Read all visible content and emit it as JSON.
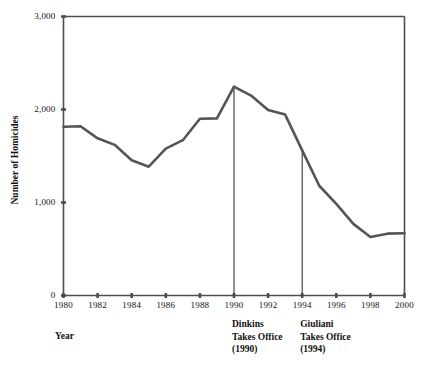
{
  "chart_data": {
    "type": "line",
    "title": "",
    "xlabel": "Year",
    "ylabel": "Number of Homicides",
    "xlim": [
      1980,
      2000
    ],
    "ylim": [
      0,
      3000
    ],
    "grid": false,
    "legend": "none",
    "x": [
      1980,
      1981,
      1982,
      1983,
      1984,
      1985,
      1986,
      1987,
      1988,
      1989,
      1990,
      1991,
      1992,
      1993,
      1994,
      1995,
      1996,
      1997,
      1998,
      1999,
      2000
    ],
    "values": [
      1815,
      1820,
      1690,
      1620,
      1455,
      1385,
      1580,
      1670,
      1900,
      1905,
      2245,
      2150,
      1995,
      1945,
      1560,
      1180,
      985,
      770,
      630,
      665,
      670
    ],
    "series": [
      {
        "name": "Number of Homicides",
        "values": [
          1815,
          1820,
          1690,
          1620,
          1455,
          1385,
          1580,
          1670,
          1900,
          1905,
          2245,
          2150,
          1995,
          1945,
          1560,
          1180,
          985,
          770,
          630,
          665,
          670
        ],
        "color": "#555555"
      }
    ],
    "y_ticks": [
      0,
      1000,
      2000,
      3000
    ],
    "y_tick_labels": [
      "0",
      "1,000",
      "2,000",
      "3,000"
    ],
    "x_ticks": [
      1980,
      1982,
      1984,
      1986,
      1988,
      1990,
      1992,
      1994,
      1996,
      1998,
      2000
    ],
    "x_tick_labels": [
      "1980",
      "1982",
      "1984",
      "1986",
      "1988",
      "1990",
      "1992",
      "1994",
      "1996",
      "1998",
      "2000"
    ],
    "annotations": [
      {
        "x": 1990,
        "line1": "Dinkins",
        "line2": "Takes Office",
        "line3": "(1990)"
      },
      {
        "x": 1994,
        "line1": "Giuliani",
        "line2": "Takes Office",
        "line3": "(1994)"
      }
    ],
    "axis_color": "#4d4d4d",
    "line_color": "#555555"
  }
}
